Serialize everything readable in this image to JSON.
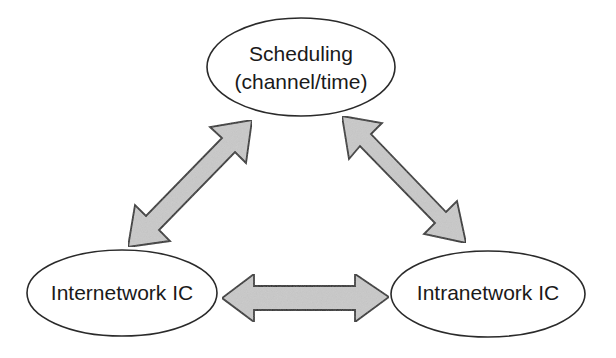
{
  "diagram": {
    "nodes": [
      {
        "id": "scheduling",
        "lines": [
          "Scheduling",
          "(channel/time)"
        ],
        "shape": "ellipse"
      },
      {
        "id": "internetwork",
        "lines": [
          "Internetwork IC"
        ],
        "shape": "ellipse"
      },
      {
        "id": "intranetwork",
        "lines": [
          "Intranetwork IC"
        ],
        "shape": "ellipse"
      }
    ],
    "edges": [
      {
        "from": "scheduling",
        "to": "internetwork",
        "type": "bidirectional-block-arrow"
      },
      {
        "from": "scheduling",
        "to": "intranetwork",
        "type": "bidirectional-block-arrow"
      },
      {
        "from": "internetwork",
        "to": "intranetwork",
        "type": "bidirectional-block-arrow"
      }
    ],
    "colors": {
      "arrow_fill": "#c9c9c9",
      "arrow_stroke": "#2e2e2e",
      "node_stroke": "#2a2a2a",
      "text": "#1a1a1a",
      "background": "#ffffff"
    }
  }
}
